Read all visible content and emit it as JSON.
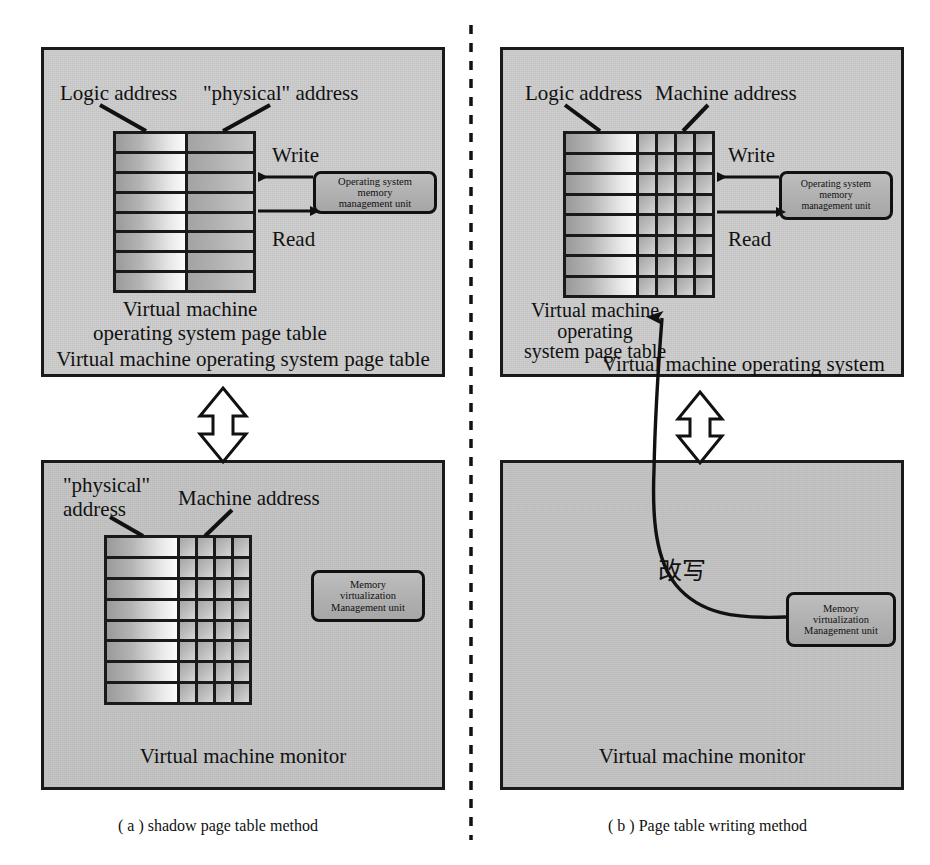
{
  "figure": {
    "title_a": "( a ) shadow page table method",
    "title_b": "( b ) Page table writing method"
  },
  "panel_a_top": {
    "name": "virtual-machine-operating-system-panel",
    "labels": {
      "logic_address": "Logic address",
      "physical_address": "\"physical\" address",
      "write": "Write",
      "read": "Read",
      "table_caption_line1": "Virtual machine",
      "table_caption_line2": "operating system page table",
      "panel_caption": "Virtual machine operating system page table"
    },
    "mmu_box": {
      "line1": "Operating system",
      "line2": "memory",
      "line3": "management unit"
    },
    "page_table": {
      "rows": 8,
      "columns": [
        "logic-address-column",
        "physical-address-column"
      ]
    }
  },
  "panel_a_bottom": {
    "name": "virtual-machine-monitor-panel",
    "labels": {
      "physical_address_line1": "\"physical\"",
      "physical_address_line2": "address",
      "machine_address": "Machine address",
      "panel_caption": "Virtual machine monitor"
    },
    "mmu_box": {
      "line1": "Memory",
      "line2": "virtualization",
      "line3": "Management unit"
    },
    "page_table": {
      "rows": 8,
      "wide_columns": 1,
      "narrow_columns": 4
    }
  },
  "panel_b_top": {
    "name": "virtual-machine-operating-system-panel",
    "labels": {
      "logic_address": "Logic address",
      "machine_address": "Machine address",
      "write": "Write",
      "read": "Read",
      "table_caption_line1": "Virtual machine",
      "table_caption_line2": "operating",
      "table_caption_line3": "system page table",
      "panel_caption": "Virtual machine operating system"
    },
    "mmu_box": {
      "line1": "Operating system",
      "line2": "memory",
      "line3": "management unit"
    },
    "page_table": {
      "rows": 8,
      "wide_columns": 1,
      "narrow_columns": 4
    }
  },
  "panel_b_bottom": {
    "name": "virtual-machine-monitor-panel",
    "labels": {
      "rewrite": "改写",
      "panel_caption": "Virtual machine monitor"
    },
    "mmu_box": {
      "line1": "Memory",
      "line2": "virtualization",
      "line3": "Management unit"
    }
  },
  "connectors": {
    "double_arrow_a": "bidirectional-arrow",
    "double_arrow_b": "bidirectional-arrow",
    "curve_b": "rewrite-curve-arrow",
    "divider": "vertical-dashed-divider"
  },
  "colors": {
    "panel_bg": "#cdcdcd",
    "panel_bg_dark": "#c3c3c3",
    "stroke": "#1a1a1a",
    "unit_box_bg": "#b4b4b4",
    "page_bg": "#ffffff"
  }
}
